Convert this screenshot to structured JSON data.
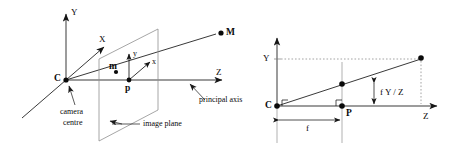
{
  "figure": {
    "stroke_color": "#151515",
    "dotted_color": "#9a9a9a",
    "background": "#ffffff",
    "left_panel": {
      "name": "3D pinhole camera model",
      "axis_labels": {
        "world_y": "Y",
        "world_x": "X",
        "world_z": "Z",
        "image_y": "y",
        "image_x": "x"
      },
      "points": {
        "camera_centre": "C",
        "principal_point": "p",
        "image_point": "m",
        "scene_point": "M"
      },
      "annotations": [
        "camera",
        "centre",
        "image plane",
        "principal axis"
      ],
      "camera_centre_caption_line1": "camera",
      "camera_centre_caption_line2": "centre",
      "image_plane_caption": "image plane",
      "principal_axis_caption": "principal axis"
    },
    "right_panel": {
      "name": "Side view of pinhole projection",
      "axis_labels": {
        "vertical_y": "Y",
        "horizontal_z": "Z"
      },
      "points": {
        "camera_centre": "C",
        "principal_point": "P"
      },
      "measures": {
        "focal_length": "f",
        "projected_height": "f Y / Z"
      }
    }
  }
}
